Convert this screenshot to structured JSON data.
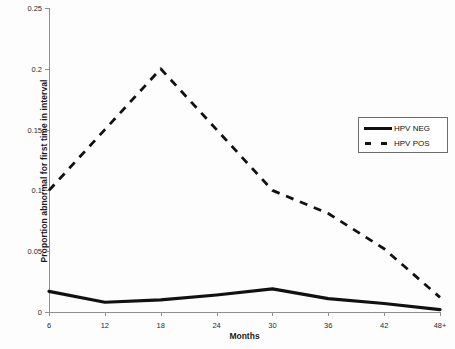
{
  "chart_data": {
    "type": "line",
    "title": "",
    "xlabel": "Months",
    "ylabel": "Proportion abnormal for first time in interval",
    "categories": [
      "6",
      "12",
      "18",
      "24",
      "30",
      "36",
      "42",
      "48+"
    ],
    "xlim": [
      0,
      7
    ],
    "ylim": [
      0,
      0.25
    ],
    "yticks": [
      "0",
      "0.05",
      "0.1",
      "0.15",
      "0.2",
      "0.25"
    ],
    "ytick_values": [
      0,
      0.05,
      0.1,
      0.15,
      0.2,
      0.25
    ],
    "grid": false,
    "legend_position": "upper right",
    "series": [
      {
        "name": "HPV NEG",
        "style": "solid",
        "color": "#111111",
        "values": [
          0.017,
          0.008,
          0.01,
          0.014,
          0.019,
          0.011,
          0.007,
          0.002
        ]
      },
      {
        "name": "HPV POS",
        "style": "dashed",
        "color": "#111111",
        "values": [
          0.1,
          0.15,
          0.2,
          0.15,
          0.1,
          0.081,
          0.052,
          0.012
        ]
      }
    ]
  },
  "legend": {
    "items": [
      {
        "label": "HPV NEG",
        "key": "solid-line-key"
      },
      {
        "label": "HPV POS",
        "key": "dashed-line-key"
      }
    ]
  }
}
